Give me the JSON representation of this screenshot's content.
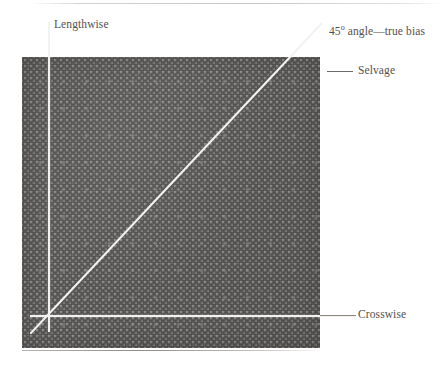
{
  "figure": {
    "swatch": {
      "name": "fabric-swatch",
      "base_color": "#555352",
      "dot_color": "#97918c"
    },
    "guides": [
      {
        "id": "lengthwise",
        "label": "Lengthwise",
        "orientation": "vertical",
        "color": "#f4f2ef"
      },
      {
        "id": "bias",
        "label": "45º angle—true bias",
        "orientation": "diagonal",
        "angle": "45",
        "color": "#f4f2ef"
      },
      {
        "id": "selvage",
        "label": "Selvage",
        "orientation": "edge",
        "color": "#6d6a68"
      },
      {
        "id": "crosswise",
        "label": "Crosswise",
        "orientation": "horizontal",
        "color": "#f4f2ef"
      }
    ],
    "labels": {
      "lengthwise": "Lengthwise",
      "bias_prefix": "45",
      "bias_degree": "o",
      "bias_suffix": " angle—true bias",
      "bias_full": "45º angle—true bias",
      "selvage": "Selvage",
      "crosswise": "Crosswise"
    }
  }
}
